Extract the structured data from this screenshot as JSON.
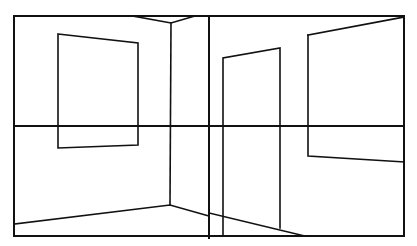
{
  "diagram": {
    "title": "Two-point room perspective line drawing",
    "stroke_color": "#111111",
    "background": "#ffffff",
    "frame": {
      "x1": 14,
      "y1": 16,
      "x2": 404,
      "y2": 236
    },
    "horizon_line": {
      "x1": 14,
      "y1": 126,
      "x2": 404,
      "y2": 126
    },
    "center_divider": {
      "x1": 209,
      "y1": 16,
      "x2": 209,
      "y2": 238
    },
    "left_room": {
      "ceiling_corner": [
        [
          133,
          16
        ],
        [
          171,
          23
        ],
        [
          195,
          16
        ]
      ],
      "wall_corner": {
        "x1": 171,
        "y1": 23,
        "x2": 170,
        "y2": 205
      },
      "floor_lines": [
        [
          14,
          224
        ],
        [
          170,
          205
        ],
        [
          209,
          216
        ]
      ],
      "window": [
        [
          58,
          34
        ],
        [
          138,
          43
        ],
        [
          138,
          145
        ],
        [
          58,
          148
        ]
      ]
    },
    "right_room": {
      "door": [
        [
          223,
          235
        ],
        [
          223,
          58
        ],
        [
          280,
          48
        ],
        [
          280,
          228
        ]
      ],
      "floor_line": [
        [
          209,
          213
        ],
        [
          305,
          236
        ]
      ],
      "ceiling_line": [
        [
          308,
          35
        ],
        [
          404,
          17
        ]
      ],
      "window": [
        [
          308,
          35
        ],
        [
          308,
          156
        ],
        [
          404,
          162
        ]
      ]
    }
  }
}
